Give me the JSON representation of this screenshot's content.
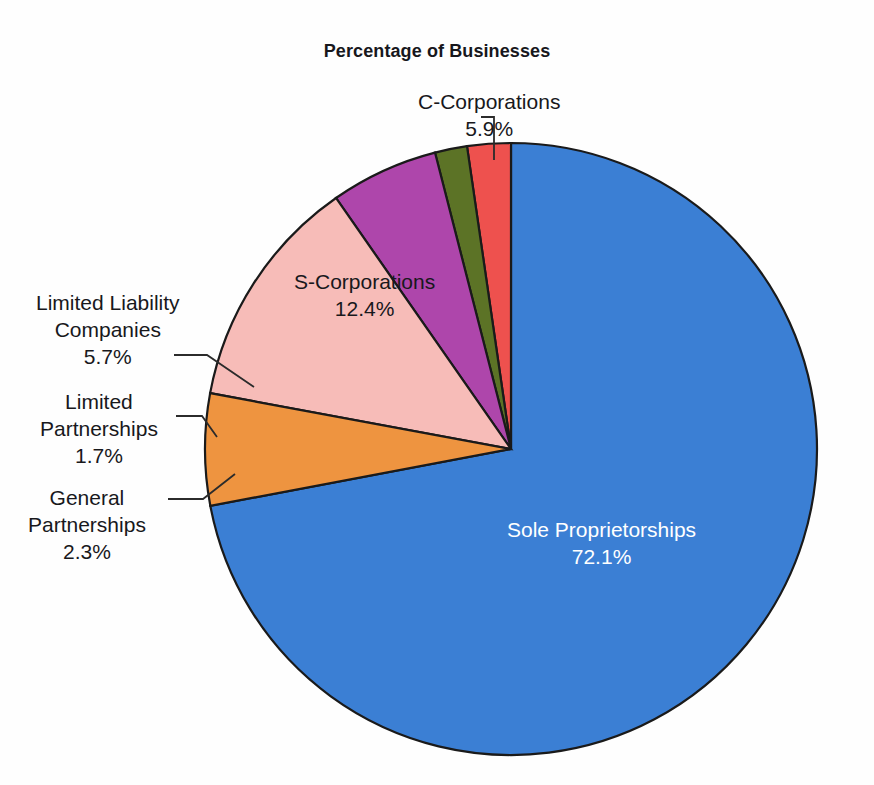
{
  "chart_data": {
    "type": "pie",
    "title": "Percentage of Businesses",
    "xlabel": "",
    "ylabel": "",
    "legend_position": "none",
    "units": "percent",
    "categories": [
      "Sole Proprietorships",
      "C-Corporations",
      "S-Corporations",
      "Limited Liability Companies",
      "Limited Partnerships",
      "General Partnerships"
    ],
    "values": [
      72.1,
      5.9,
      12.4,
      5.7,
      1.7,
      2.3
    ],
    "slices": [
      {
        "label": "Sole Proprietorships",
        "value": 72.1,
        "value_text": "72.1%",
        "color": "#3b7fd4",
        "label_placement": "inside",
        "label_color": "#ffffff"
      },
      {
        "label": "C-Corporations",
        "value": 5.9,
        "value_text": "5.9%",
        "color": "#ee9440",
        "label_placement": "callout",
        "label_color": "#18181c"
      },
      {
        "label": "S-Corporations",
        "value": 12.4,
        "value_text": "12.4%",
        "color": "#f7bcb8",
        "label_placement": "inside",
        "label_color": "#18181c"
      },
      {
        "label": "Limited Liability Companies",
        "label_line1": "Limited Liability",
        "label_line2": "Companies",
        "value": 5.7,
        "value_text": "5.7%",
        "color": "#ae46ab",
        "label_placement": "callout",
        "label_color": "#18181c"
      },
      {
        "label": "Limited Partnerships",
        "label_line1": "Limited",
        "label_line2": "Partnerships",
        "value": 1.7,
        "value_text": "1.7%",
        "color": "#5c7326",
        "label_placement": "callout",
        "label_color": "#18181c"
      },
      {
        "label": "General Partnerships",
        "label_line1": "General",
        "label_line2": "Partnerships",
        "value": 2.3,
        "value_text": "2.3%",
        "color": "#ee514e",
        "label_placement": "callout",
        "label_color": "#18181c"
      }
    ],
    "start_angle_deg": 0,
    "direction": "clockwise",
    "total": 100.1
  },
  "labels": {
    "ccorp_name": "C-Corporations",
    "ccorp_pct": "5.9%",
    "scorp_name": "S-Corporations",
    "scorp_pct": "12.4%",
    "llc_line1": "Limited Liability",
    "llc_line2": "Companies",
    "llc_pct": "5.7%",
    "lp_line1": "Limited",
    "lp_line2": "Partnerships",
    "lp_pct": "1.7%",
    "gp_line1": "General",
    "gp_line2": "Partnerships",
    "gp_pct": "2.3%",
    "sole_name": "Sole Proprietorships",
    "sole_pct": "72.1%"
  },
  "colors": {
    "blue": "#3b7fd4",
    "orange": "#ee9440",
    "pink": "#f7bcb8",
    "purple": "#ae46ab",
    "olive": "#5c7326",
    "red": "#ee514e",
    "outline": "#1a1a1a",
    "background": "#fefefe"
  }
}
